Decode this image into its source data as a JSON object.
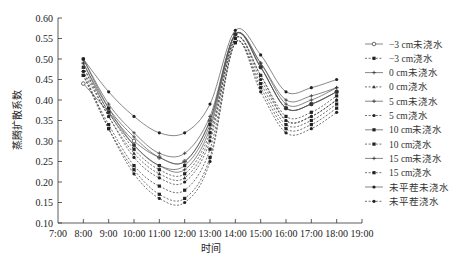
{
  "chart_data": {
    "type": "line",
    "title": "",
    "xlabel": "时间",
    "ylabel": "蒸腾扩散系数",
    "x_ticks": [
      "7:00",
      "8:00",
      "9:00",
      "10:00",
      "11:00",
      "12:00",
      "13:00",
      "14:00",
      "15:00",
      "16:00",
      "17:00",
      "18:00",
      "19:00"
    ],
    "y_ticks": [
      "0.10",
      "0.15",
      "0.20",
      "0.25",
      "0.30",
      "0.35",
      "0.40",
      "0.45",
      "0.50",
      "0.55",
      "0.60"
    ],
    "xlim": [
      7,
      19
    ],
    "ylim": [
      0.1,
      0.6
    ],
    "grid": false,
    "legend_position": "right",
    "x": [
      8,
      9,
      10,
      11,
      12,
      13,
      14,
      15,
      16,
      17,
      18
    ],
    "series": [
      {
        "name": "−3 cm未浇水",
        "style": "solid",
        "marker": "circle-open",
        "values": [
          0.44,
          0.37,
          0.3,
          0.26,
          0.25,
          0.35,
          0.56,
          0.48,
          0.38,
          0.39,
          0.42
        ]
      },
      {
        "name": "−3 cm浇水",
        "style": "dashed",
        "marker": "square",
        "values": [
          0.48,
          0.37,
          0.28,
          0.23,
          0.22,
          0.32,
          0.55,
          0.46,
          0.36,
          0.37,
          0.41
        ]
      },
      {
        "name": "0 cm未浇水",
        "style": "solid",
        "marker": "plus",
        "values": [
          0.49,
          0.38,
          0.31,
          0.26,
          0.25,
          0.35,
          0.56,
          0.49,
          0.39,
          0.4,
          0.43
        ]
      },
      {
        "name": "0 cm浇水",
        "style": "dashed",
        "marker": "triangle",
        "values": [
          0.48,
          0.36,
          0.27,
          0.22,
          0.21,
          0.31,
          0.55,
          0.46,
          0.35,
          0.36,
          0.4
        ]
      },
      {
        "name": "5 cm未浇水",
        "style": "solid",
        "marker": "plus",
        "values": [
          0.5,
          0.39,
          0.32,
          0.27,
          0.27,
          0.36,
          0.56,
          0.49,
          0.4,
          0.41,
          0.43
        ]
      },
      {
        "name": "5 cm浇水",
        "style": "dashed",
        "marker": "dot",
        "values": [
          0.47,
          0.36,
          0.26,
          0.21,
          0.2,
          0.3,
          0.55,
          0.45,
          0.35,
          0.36,
          0.4
        ]
      },
      {
        "name": "10 cm未浇水",
        "style": "solid",
        "marker": "square",
        "values": [
          0.5,
          0.38,
          0.29,
          0.24,
          0.24,
          0.34,
          0.56,
          0.48,
          0.38,
          0.39,
          0.42
        ]
      },
      {
        "name": "10 cm浇水",
        "style": "dashed",
        "marker": "square",
        "values": [
          0.46,
          0.34,
          0.24,
          0.19,
          0.18,
          0.28,
          0.54,
          0.44,
          0.34,
          0.35,
          0.39
        ]
      },
      {
        "name": "15 cm未浇水",
        "style": "solid",
        "marker": "plus",
        "values": [
          0.49,
          0.37,
          0.29,
          0.24,
          0.23,
          0.33,
          0.56,
          0.48,
          0.38,
          0.39,
          0.42
        ]
      },
      {
        "name": "15 cm浇水",
        "style": "dashed",
        "marker": "square",
        "values": [
          0.46,
          0.33,
          0.23,
          0.17,
          0.16,
          0.26,
          0.54,
          0.43,
          0.33,
          0.34,
          0.38
        ]
      },
      {
        "name": "未平茬未浇水",
        "style": "solid",
        "marker": "dot",
        "values": [
          0.5,
          0.42,
          0.36,
          0.32,
          0.32,
          0.39,
          0.57,
          0.51,
          0.42,
          0.43,
          0.45
        ]
      },
      {
        "name": "未平茬浇水",
        "style": "dashed",
        "marker": "dot",
        "values": [
          0.47,
          0.33,
          0.22,
          0.16,
          0.15,
          0.25,
          0.54,
          0.42,
          0.32,
          0.33,
          0.37
        ]
      }
    ]
  },
  "colors": {
    "axis": "#333333",
    "line": "#444444",
    "text": "#222222"
  }
}
